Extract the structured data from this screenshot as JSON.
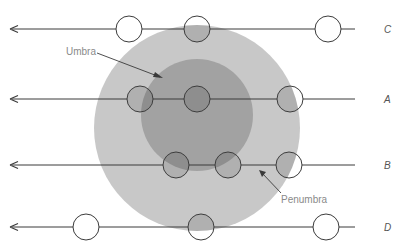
{
  "diagram": {
    "type": "lunar-eclipse-shadow-paths",
    "colors": {
      "background": "#ffffff",
      "penumbra": "#c8c8c8",
      "umbra": "#a2a2a2",
      "moon_stroke": "#3c3c3c",
      "moon_in_penumbra": "#b0b0b0",
      "moon_in_umbra": "#8e8e8e",
      "line": "#3a3a3a",
      "label_text": "#8a8a8a"
    },
    "shadow": {
      "penumbra": {
        "label": "Penumbra",
        "cx": 197,
        "cy": 128,
        "r": 103
      },
      "umbra": {
        "label": "Umbra",
        "cx": 197,
        "cy": 115,
        "r": 56
      }
    },
    "labels": {
      "umbra": "Umbra",
      "penumbra": "Penumbra"
    },
    "tracks": [
      {
        "id": "C",
        "label": "C",
        "y": 29,
        "moons_x": [
          129,
          197,
          328
        ]
      },
      {
        "id": "A",
        "label": "A",
        "y": 99,
        "moons_x": [
          140,
          197,
          290
        ]
      },
      {
        "id": "B",
        "label": "B",
        "y": 165,
        "moons_x": [
          176,
          228,
          289
        ]
      },
      {
        "id": "D",
        "label": "D",
        "y": 227,
        "moons_x": [
          86,
          201,
          326
        ]
      }
    ],
    "moon_radius": 13,
    "arrow_direction": "left"
  }
}
